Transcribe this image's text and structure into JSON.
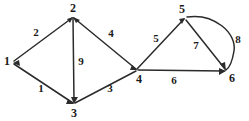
{
  "figure": {
    "type": "directed-weighted-graph",
    "background_color": "#ffffff",
    "ink_color": "#2b2b2b",
    "width": 249,
    "height": 121
  },
  "vertices": [
    {
      "id": "v1",
      "label": "1",
      "x": 13,
      "y": 62,
      "label_x": 7,
      "label_y": 61
    },
    {
      "id": "v2",
      "label": "2",
      "x": 73,
      "y": 17,
      "label_x": 73,
      "label_y": 8
    },
    {
      "id": "v3",
      "label": "3",
      "x": 74,
      "y": 104,
      "label_x": 74,
      "label_y": 113
    },
    {
      "id": "v4",
      "label": "4",
      "x": 137,
      "y": 70,
      "label_x": 139,
      "label_y": 79
    },
    {
      "id": "v5",
      "label": "5",
      "x": 185,
      "y": 18,
      "label_x": 182,
      "label_y": 9
    },
    {
      "id": "v6",
      "label": "6",
      "x": 226,
      "y": 71,
      "label_x": 232,
      "label_y": 78
    }
  ],
  "edges": [
    {
      "id": "e1",
      "from": "v1",
      "to": "v2",
      "weight": "2",
      "shape": "line",
      "label_x": 36,
      "label_y": 32
    },
    {
      "id": "e2",
      "from": "v1",
      "to": "v3",
      "weight": "1",
      "shape": "line",
      "label_x": 41,
      "label_y": 88
    },
    {
      "id": "e3",
      "from": "v2",
      "to": "v3",
      "weight": "9",
      "shape": "line",
      "label_x": 81,
      "label_y": 61
    },
    {
      "id": "e4",
      "from": "v2",
      "to": "v4",
      "weight": "4",
      "shape": "line",
      "label_x": 111,
      "label_y": 33
    },
    {
      "id": "e5",
      "from": "v3",
      "to": "v4",
      "weight": "3",
      "shape": "line",
      "label_x": 110,
      "label_y": 88
    },
    {
      "id": "e6",
      "from": "v4",
      "to": "v5",
      "weight": "5",
      "shape": "line",
      "label_x": 156,
      "label_y": 38
    },
    {
      "id": "e7",
      "from": "v4",
      "to": "v6",
      "weight": "6",
      "shape": "line",
      "label_x": 174,
      "label_y": 80
    },
    {
      "id": "e8",
      "from": "v5",
      "to": "v6",
      "weight": "7",
      "shape": "line",
      "label_x": 196,
      "label_y": 45
    },
    {
      "id": "e9",
      "from": "v5",
      "to": "v6",
      "weight": "8",
      "shape": "arc",
      "label_x": 238,
      "label_y": 39
    }
  ]
}
